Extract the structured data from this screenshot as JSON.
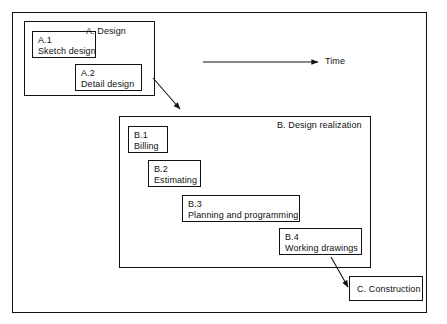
{
  "diagram": {
    "title_hidden": "",
    "time_axis": {
      "label": "Time",
      "arrow_name": "time-arrow"
    },
    "groups": [
      {
        "id": "A",
        "label": "A.  Design",
        "items": [
          {
            "code": "A.1",
            "title": "Sketch design"
          },
          {
            "code": "A.2",
            "title": "Detail design"
          }
        ]
      },
      {
        "id": "B",
        "label": "B.  Design realization",
        "items": [
          {
            "code": "B.1",
            "title": "Billing"
          },
          {
            "code": "B.2",
            "title": "Estimating"
          },
          {
            "code": "B.3",
            "title": "Planning and programming"
          },
          {
            "code": "B.4",
            "title": "Working drawings"
          }
        ]
      }
    ],
    "terminal": {
      "label": "C.  Construction"
    },
    "colors": {
      "stroke": "#111111",
      "background": "#ffffff",
      "text": "#111111"
    }
  }
}
